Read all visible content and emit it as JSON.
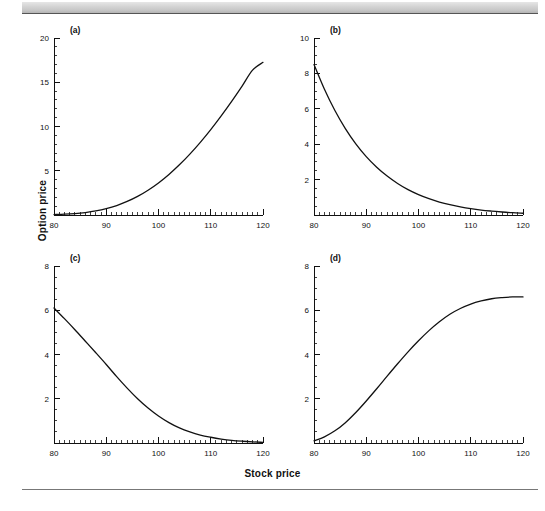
{
  "figure": {
    "xlabel": "Stock price",
    "ylabel": "Option price"
  },
  "panels": [
    {
      "tag": "(a)"
    },
    {
      "tag": "(b)"
    },
    {
      "tag": "(c)"
    },
    {
      "tag": "(d)"
    }
  ],
  "chart_data": [
    {
      "type": "line",
      "panel": "(a)",
      "title": "",
      "xlabel": "Stock price",
      "ylabel": "Option price",
      "xlim": [
        80,
        120
      ],
      "ylim": [
        0,
        20
      ],
      "xticks": [
        80,
        90,
        100,
        110,
        120
      ],
      "yticks": [
        0,
        5,
        10,
        15,
        20
      ],
      "xtick_labels": [
        "80",
        "90",
        "100",
        "110",
        "120"
      ],
      "ytick_labels": [
        "",
        "5",
        "10",
        "15",
        "20"
      ],
      "minor_tick_step_x": 1,
      "minor_tick_step_y": 1,
      "grid": false,
      "legend": null,
      "x": [
        80,
        82,
        84,
        86,
        88,
        90,
        92,
        94,
        96,
        98,
        100,
        102,
        104,
        106,
        108,
        110,
        112,
        114,
        116,
        118,
        120
      ],
      "values": [
        0.05,
        0.09,
        0.16,
        0.28,
        0.46,
        0.72,
        1.07,
        1.53,
        2.1,
        2.8,
        3.62,
        4.58,
        5.67,
        6.88,
        8.21,
        9.65,
        11.2,
        12.84,
        14.57,
        16.37,
        17.25
      ]
    },
    {
      "type": "line",
      "panel": "(b)",
      "title": "",
      "xlabel": "Stock price",
      "ylabel": "Option price",
      "xlim": [
        80,
        120
      ],
      "ylim": [
        0,
        10
      ],
      "xticks": [
        80,
        90,
        100,
        110,
        120
      ],
      "yticks": [
        0,
        2,
        4,
        6,
        8,
        10
      ],
      "xtick_labels": [
        "80",
        "90",
        "100",
        "110",
        "120"
      ],
      "ytick_labels": [
        "",
        "2",
        "4",
        "6",
        "8",
        "10"
      ],
      "minor_tick_step_x": 1,
      "minor_tick_step_y": 0.5,
      "grid": false,
      "legend": null,
      "x": [
        80,
        82,
        84,
        86,
        88,
        90,
        92,
        94,
        96,
        98,
        100,
        102,
        104,
        106,
        108,
        110,
        112,
        114,
        116,
        118,
        120
      ],
      "values": [
        8.5,
        7.1,
        5.9,
        4.88,
        4.02,
        3.3,
        2.7,
        2.2,
        1.78,
        1.43,
        1.15,
        0.92,
        0.73,
        0.58,
        0.46,
        0.36,
        0.28,
        0.22,
        0.17,
        0.13,
        0.1
      ]
    },
    {
      "type": "line",
      "panel": "(c)",
      "title": "",
      "xlabel": "Stock price",
      "ylabel": "Option price",
      "xlim": [
        80,
        120
      ],
      "ylim": [
        0,
        8
      ],
      "xticks": [
        80,
        90,
        100,
        110,
        120
      ],
      "yticks": [
        0,
        2,
        4,
        6,
        8
      ],
      "xtick_labels": [
        "80",
        "90",
        "100",
        "110",
        "120"
      ],
      "ytick_labels": [
        "",
        "2",
        "4",
        "6",
        "8"
      ],
      "minor_tick_step_x": 1,
      "minor_tick_step_y": 0.5,
      "grid": false,
      "legend": null,
      "x": [
        80,
        82,
        84,
        86,
        88,
        90,
        92,
        94,
        96,
        98,
        100,
        102,
        104,
        106,
        108,
        110,
        112,
        114,
        116,
        118,
        120
      ],
      "values": [
        6.1,
        5.62,
        5.12,
        4.6,
        4.08,
        3.55,
        3.0,
        2.48,
        2.0,
        1.58,
        1.22,
        0.92,
        0.68,
        0.5,
        0.36,
        0.26,
        0.18,
        0.12,
        0.08,
        0.05,
        0.03
      ]
    },
    {
      "type": "line",
      "panel": "(d)",
      "title": "",
      "xlabel": "Stock price",
      "ylabel": "Option price",
      "xlim": [
        80,
        120
      ],
      "ylim": [
        0,
        8
      ],
      "xticks": [
        80,
        90,
        100,
        110,
        120
      ],
      "yticks": [
        0,
        2,
        4,
        6,
        8
      ],
      "xtick_labels": [
        "80",
        "90",
        "100",
        "110",
        "120"
      ],
      "ytick_labels": [
        "",
        "2",
        "4",
        "6",
        "8"
      ],
      "minor_tick_step_x": 1,
      "minor_tick_step_y": 0.5,
      "grid": false,
      "legend": null,
      "x": [
        80,
        82,
        84,
        86,
        88,
        90,
        92,
        94,
        96,
        98,
        100,
        102,
        104,
        106,
        108,
        110,
        112,
        114,
        116,
        118,
        120
      ],
      "values": [
        0.1,
        0.28,
        0.55,
        0.92,
        1.38,
        1.9,
        2.45,
        3.02,
        3.58,
        4.12,
        4.62,
        5.08,
        5.48,
        5.82,
        6.08,
        6.28,
        6.42,
        6.52,
        6.57,
        6.6,
        6.6
      ]
    }
  ]
}
